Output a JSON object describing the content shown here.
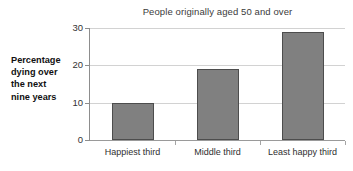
{
  "chart_data": {
    "type": "bar",
    "title": "People originally aged 50 and over",
    "xlabel": "",
    "ylabel": "Percentage dying over the next nine years",
    "ylabel_lines": [
      "Percentage",
      "dying over",
      "the next",
      "nine years"
    ],
    "categories": [
      "Happiest third",
      "Middle third",
      "Least happy third"
    ],
    "values": [
      10,
      19,
      29
    ],
    "ylim": [
      0,
      30
    ],
    "yticks": [
      0,
      10,
      20,
      30
    ],
    "ytick_labels": [
      "0",
      "10",
      "20",
      "30"
    ],
    "grid": true,
    "legend": false,
    "bar_color": "#808080",
    "bar_border_color": "#4d4d4d",
    "gridline_color": "#d2d2d2",
    "axis_color": "#8d8d8d",
    "background": "#ffffff"
  }
}
